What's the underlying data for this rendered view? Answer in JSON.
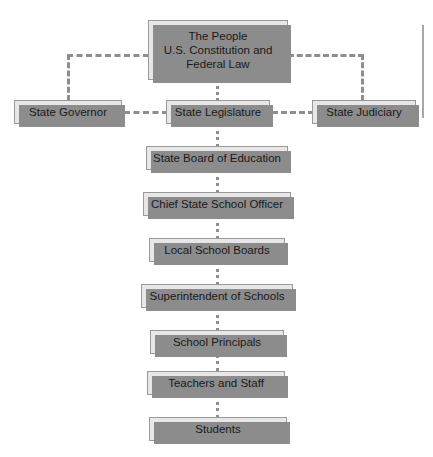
{
  "diagram": {
    "type": "hierarchy-flowchart",
    "style": {
      "box_fill": "#e7e7e7",
      "box_border": "#9a9a9a",
      "box_shadow": "#8c8c8c",
      "connector": "#8e8e8e",
      "background": "#ffffff",
      "text": "#1a1a1a"
    },
    "nodes": [
      {
        "id": "people",
        "label": "The People\nU.S. Constitution and\nFederal Law",
        "x": 148,
        "y": 20,
        "w": 140,
        "h": 60,
        "multiline": true
      },
      {
        "id": "governor",
        "label": "State Governor",
        "x": 14,
        "y": 100,
        "w": 108,
        "h": 24
      },
      {
        "id": "legislature",
        "label": "State Legislature",
        "x": 166,
        "y": 100,
        "w": 104,
        "h": 24
      },
      {
        "id": "judiciary",
        "label": "State Judiciary",
        "x": 312,
        "y": 100,
        "w": 104,
        "h": 24
      },
      {
        "id": "state-board",
        "label": "State Board of Education",
        "x": 146,
        "y": 146,
        "w": 142,
        "h": 24
      },
      {
        "id": "chief-officer",
        "label": "Chief State School Officer",
        "x": 143,
        "y": 192,
        "w": 148,
        "h": 24
      },
      {
        "id": "local-boards",
        "label": "Local School Boards",
        "x": 149,
        "y": 238,
        "w": 136,
        "h": 24
      },
      {
        "id": "superintendent",
        "label": "Superintendent of Schools",
        "x": 141,
        "y": 284,
        "w": 152,
        "h": 24
      },
      {
        "id": "principals",
        "label": "School Principals",
        "x": 150,
        "y": 330,
        "w": 134,
        "h": 24
      },
      {
        "id": "teachers",
        "label": "Teachers and Staff",
        "x": 147,
        "y": 371,
        "w": 138,
        "h": 24
      },
      {
        "id": "students",
        "label": "Students",
        "x": 149,
        "y": 417,
        "w": 138,
        "h": 24
      }
    ],
    "connectors": [
      {
        "id": "people-to-governor-h",
        "from": "people",
        "to": "governor"
      },
      {
        "id": "people-to-judiciary-h",
        "from": "people",
        "to": "judiciary"
      },
      {
        "id": "people-to-legislature-v",
        "from": "people",
        "to": "legislature"
      },
      {
        "id": "governor-to-legislature-h",
        "from": "governor",
        "to": "legislature"
      },
      {
        "id": "legislature-to-judiciary-h",
        "from": "legislature",
        "to": "judiciary"
      },
      {
        "id": "legislature-to-state-board-v",
        "from": "legislature",
        "to": "state-board"
      },
      {
        "id": "state-board-to-chief-officer-v",
        "from": "state-board",
        "to": "chief-officer"
      },
      {
        "id": "chief-officer-to-local-boards-v",
        "from": "chief-officer",
        "to": "local-boards"
      },
      {
        "id": "local-boards-to-superintendent-v",
        "from": "local-boards",
        "to": "superintendent"
      },
      {
        "id": "superintendent-to-principals-v",
        "from": "superintendent",
        "to": "principals"
      },
      {
        "id": "principals-to-teachers-v",
        "from": "principals",
        "to": "teachers"
      },
      {
        "id": "teachers-to-students-v",
        "from": "teachers",
        "to": "students"
      }
    ]
  }
}
